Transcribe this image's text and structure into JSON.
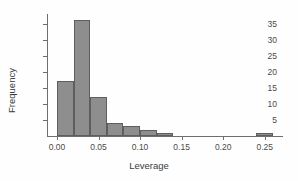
{
  "chart_data": {
    "type": "bar",
    "title": "",
    "subtitle": "",
    "xlabel": "Leverage",
    "ylabel": "Frequency",
    "xlim": [
      -0.012,
      0.272
    ],
    "ylim": [
      0,
      38
    ],
    "grid": false,
    "legend": null,
    "bin_width": 0.02,
    "xticks": [
      0.0,
      0.05,
      0.1,
      0.15,
      0.2,
      0.25
    ],
    "xtick_labels": [
      "0.00",
      "0.05",
      "0.10",
      "0.15",
      "0.20",
      "0.25"
    ],
    "yticks": [
      5,
      10,
      15,
      20,
      25,
      30,
      35
    ],
    "ytick_labels": [
      "5",
      "10",
      "15",
      "20",
      "25",
      "30",
      "35"
    ],
    "bar_color": "#8e8e8e",
    "bar_edge_color": "#5e5e5e",
    "axis_color": "#6e6e6e",
    "bins": [
      {
        "x0": 0.0,
        "x1": 0.02,
        "value": 17
      },
      {
        "x0": 0.02,
        "x1": 0.04,
        "value": 36
      },
      {
        "x0": 0.04,
        "x1": 0.06,
        "value": 12
      },
      {
        "x0": 0.06,
        "x1": 0.08,
        "value": 4
      },
      {
        "x0": 0.08,
        "x1": 0.1,
        "value": 3
      },
      {
        "x0": 0.1,
        "x1": 0.12,
        "value": 2
      },
      {
        "x0": 0.12,
        "x1": 0.14,
        "value": 1
      },
      {
        "x0": 0.24,
        "x1": 0.26,
        "value": 1
      }
    ]
  }
}
